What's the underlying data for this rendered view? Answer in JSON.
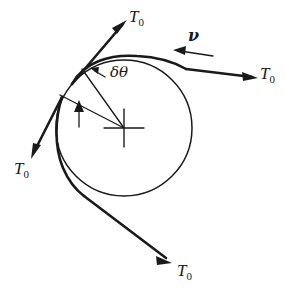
{
  "figure": {
    "width": 285,
    "height": 298,
    "background_color": "#ffffff",
    "ink_color": "#1a1a1a"
  },
  "labels": {
    "tension_top": {
      "symbol": "T",
      "subscript": "0",
      "text": "T0"
    },
    "tension_right": {
      "symbol": "T",
      "subscript": "0",
      "text": "T0"
    },
    "tension_left": {
      "symbol": "T",
      "subscript": "0",
      "text": "T0"
    },
    "tension_bottom": {
      "symbol": "T",
      "subscript": "0",
      "text": "T0"
    },
    "angle_element": "δθ",
    "velocity": "ν"
  },
  "geometry": {
    "circle": {
      "cx": 124,
      "cy": 128,
      "r": 68
    },
    "center_mark": {
      "type": "cross",
      "half_width": 20,
      "half_height": 19
    },
    "delta_theta_degrees": 28,
    "radius_arrow": "radius-indicator"
  },
  "icons": {
    "arrowhead": "arrow-head-icon",
    "center_cross": "cross-mark-icon"
  }
}
